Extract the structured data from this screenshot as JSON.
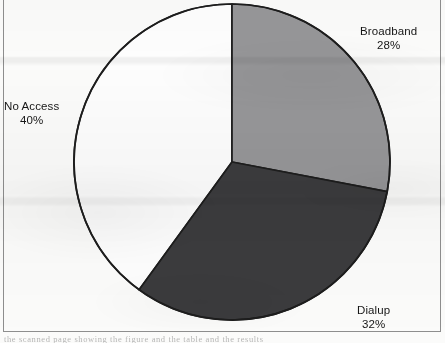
{
  "figure": {
    "background_color": "#fbfbfa",
    "border_color": "#8e8e8e",
    "bleed_text": "the scanned page showing the figure and the table and the results"
  },
  "chart_data": {
    "type": "pie",
    "title": "",
    "subtitle": "",
    "xlabel": "",
    "ylabel": "",
    "grid": false,
    "legend_position": "none",
    "label_format": "category name above percentage",
    "start_angle_deg": 0,
    "direction": "clockwise",
    "center": {
      "x": 232,
      "y": 162
    },
    "radius": 158,
    "categories": [
      "Broadband",
      "Dialup",
      "No Access"
    ],
    "values": [
      28,
      32,
      40
    ],
    "value_unit": "%",
    "colors": [
      "#969698",
      "#3b3b3d",
      "#fdfdfd"
    ],
    "outline_color": "#1d1d1d",
    "slices": [
      {
        "label": "Broadband",
        "percent_text": "28%",
        "value": 28,
        "color": "#969698",
        "start_deg": 0,
        "end_deg": 100.8
      },
      {
        "label": "Dialup",
        "percent_text": "32%",
        "value": 32,
        "color": "#3b3b3d",
        "start_deg": 100.8,
        "end_deg": 216
      },
      {
        "label": "No Access",
        "percent_text": "40%",
        "value": 40,
        "color": "#fdfdfd",
        "start_deg": 216,
        "end_deg": 360
      }
    ]
  },
  "labels": {
    "broadband": {
      "name": "Broadband",
      "percent": "28%"
    },
    "dialup": {
      "name": "Dialup",
      "percent": "32%"
    },
    "noaccess": {
      "name": "No Access",
      "percent": "40%"
    }
  }
}
